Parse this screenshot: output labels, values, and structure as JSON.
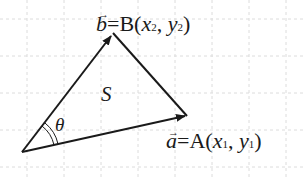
{
  "diagram": {
    "type": "vector triangle",
    "points": {
      "O": {
        "x": 22,
        "y": 152
      },
      "A": {
        "x": 187,
        "y": 116
      },
      "B": {
        "x": 113,
        "y": 33
      }
    },
    "labels": {
      "b_vec": "b",
      "b_eq": "=B(",
      "b_x": "x",
      "b_x_sub": "2",
      "b_sep": ", ",
      "b_y": "y",
      "b_y_sub": "2",
      "b_close": ")",
      "a_vec": "a",
      "a_eq": "=A(",
      "a_x": "x",
      "a_x_sub": "1",
      "a_sep": ", ",
      "a_y": "y",
      "a_y_sub": "1",
      "a_close": ")",
      "area": "S",
      "angle": "θ"
    },
    "colors": {
      "stroke": "#1a1a1a",
      "grid": "#d8d8d8",
      "background": "#ffffff"
    }
  }
}
